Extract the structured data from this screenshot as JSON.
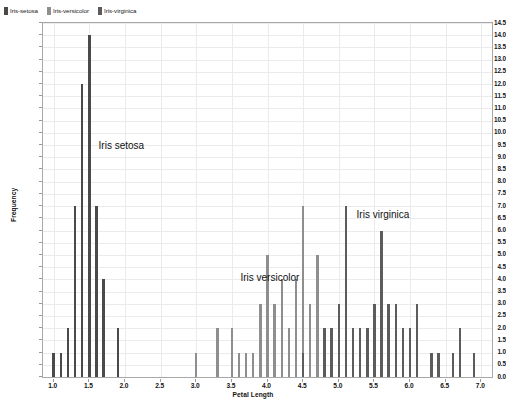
{
  "legend": {
    "position": "top-left",
    "entries": [
      {
        "label": "Iris-setosa",
        "color": "#4a4a4a",
        "icon": "square-swatch"
      },
      {
        "label": "Iris-versicolor",
        "color": "#8e8e8e",
        "icon": "square-swatch"
      },
      {
        "label": "Iris-virginica",
        "color": "#5c5c5c",
        "icon": "square-swatch"
      }
    ]
  },
  "axes": {
    "xlabel": "Petal Length",
    "ylabel": "Frequency",
    "xlim": [
      0.85,
      7.15
    ],
    "ylim": [
      0.0,
      14.5
    ],
    "xticks": [
      "1.0",
      "1.5",
      "2.0",
      "2.5",
      "3.0",
      "3.5",
      "4.0",
      "4.5",
      "5.0",
      "5.5",
      "6.0",
      "6.5",
      "7.0"
    ],
    "xtick_values": [
      1.0,
      1.5,
      2.0,
      2.5,
      3.0,
      3.5,
      4.0,
      4.5,
      5.0,
      5.5,
      6.0,
      6.5,
      7.0
    ],
    "yticks": [
      "0.0",
      "0.5",
      "1.0",
      "1.5",
      "2.0",
      "2.5",
      "3.0",
      "3.5",
      "4.0",
      "4.5",
      "5.0",
      "5.5",
      "6.0",
      "6.5",
      "7.0",
      "7.5",
      "8.0",
      "8.5",
      "9.0",
      "9.5",
      "10.0",
      "10.5",
      "11.0",
      "11.5",
      "12.0",
      "12.5",
      "13.0",
      "13.5",
      "14.0",
      "14.5"
    ],
    "ytick_values": [
      0.0,
      0.5,
      1.0,
      1.5,
      2.0,
      2.5,
      3.0,
      3.5,
      4.0,
      4.5,
      5.0,
      5.5,
      6.0,
      6.5,
      7.0,
      7.5,
      8.0,
      8.5,
      9.0,
      9.5,
      10.0,
      10.5,
      11.0,
      11.5,
      12.0,
      12.5,
      13.0,
      13.5,
      14.0,
      14.5
    ],
    "grid": true
  },
  "annotations": [
    {
      "text": "Iris setosa",
      "x": 1.63,
      "y": 9.45
    },
    {
      "text": "Iris versicolor",
      "x": 3.62,
      "y": 4.05
    },
    {
      "text": "Iris virginica",
      "x": 5.25,
      "y": 6.65
    }
  ],
  "chart_data": {
    "type": "bar",
    "title": "",
    "subtitle": "",
    "xlabel": "Petal Length",
    "ylabel": "Frequency",
    "xlim": [
      0.85,
      7.15
    ],
    "ylim": [
      0.0,
      14.5
    ],
    "grid": true,
    "legend_position": "top-left",
    "bar_width": 0.035,
    "series": [
      {
        "name": "Iris-setosa",
        "color": "#4a4a4a",
        "x": [
          1.0,
          1.1,
          1.2,
          1.3,
          1.4,
          1.5,
          1.6,
          1.7,
          1.9
        ],
        "values": [
          1,
          1,
          2,
          7,
          12,
          14,
          7,
          4,
          2
        ]
      },
      {
        "name": "Iris-versicolor",
        "color": "#8e8e8e",
        "x": [
          3.0,
          3.3,
          3.5,
          3.6,
          3.7,
          3.8,
          3.9,
          4.0,
          4.1,
          4.2,
          4.3,
          4.4,
          4.5,
          4.6,
          4.7,
          4.8,
          4.9,
          5.0,
          5.1
        ],
        "values": [
          1,
          2,
          2,
          1,
          1,
          1,
          3,
          5,
          3,
          4,
          2,
          4,
          7,
          3,
          5,
          2,
          2,
          1,
          1
        ]
      },
      {
        "name": "Iris-virginica",
        "color": "#5c5c5c",
        "x": [
          4.5,
          4.8,
          4.9,
          5.0,
          5.1,
          5.2,
          5.3,
          5.4,
          5.5,
          5.6,
          5.7,
          5.8,
          5.9,
          6.0,
          6.1,
          6.3,
          6.4,
          6.6,
          6.7,
          6.9
        ],
        "values": [
          1,
          2,
          2,
          3,
          7,
          2,
          2,
          2,
          3,
          6,
          3,
          3,
          2,
          2,
          3,
          1,
          1,
          1,
          2,
          1
        ]
      }
    ]
  }
}
